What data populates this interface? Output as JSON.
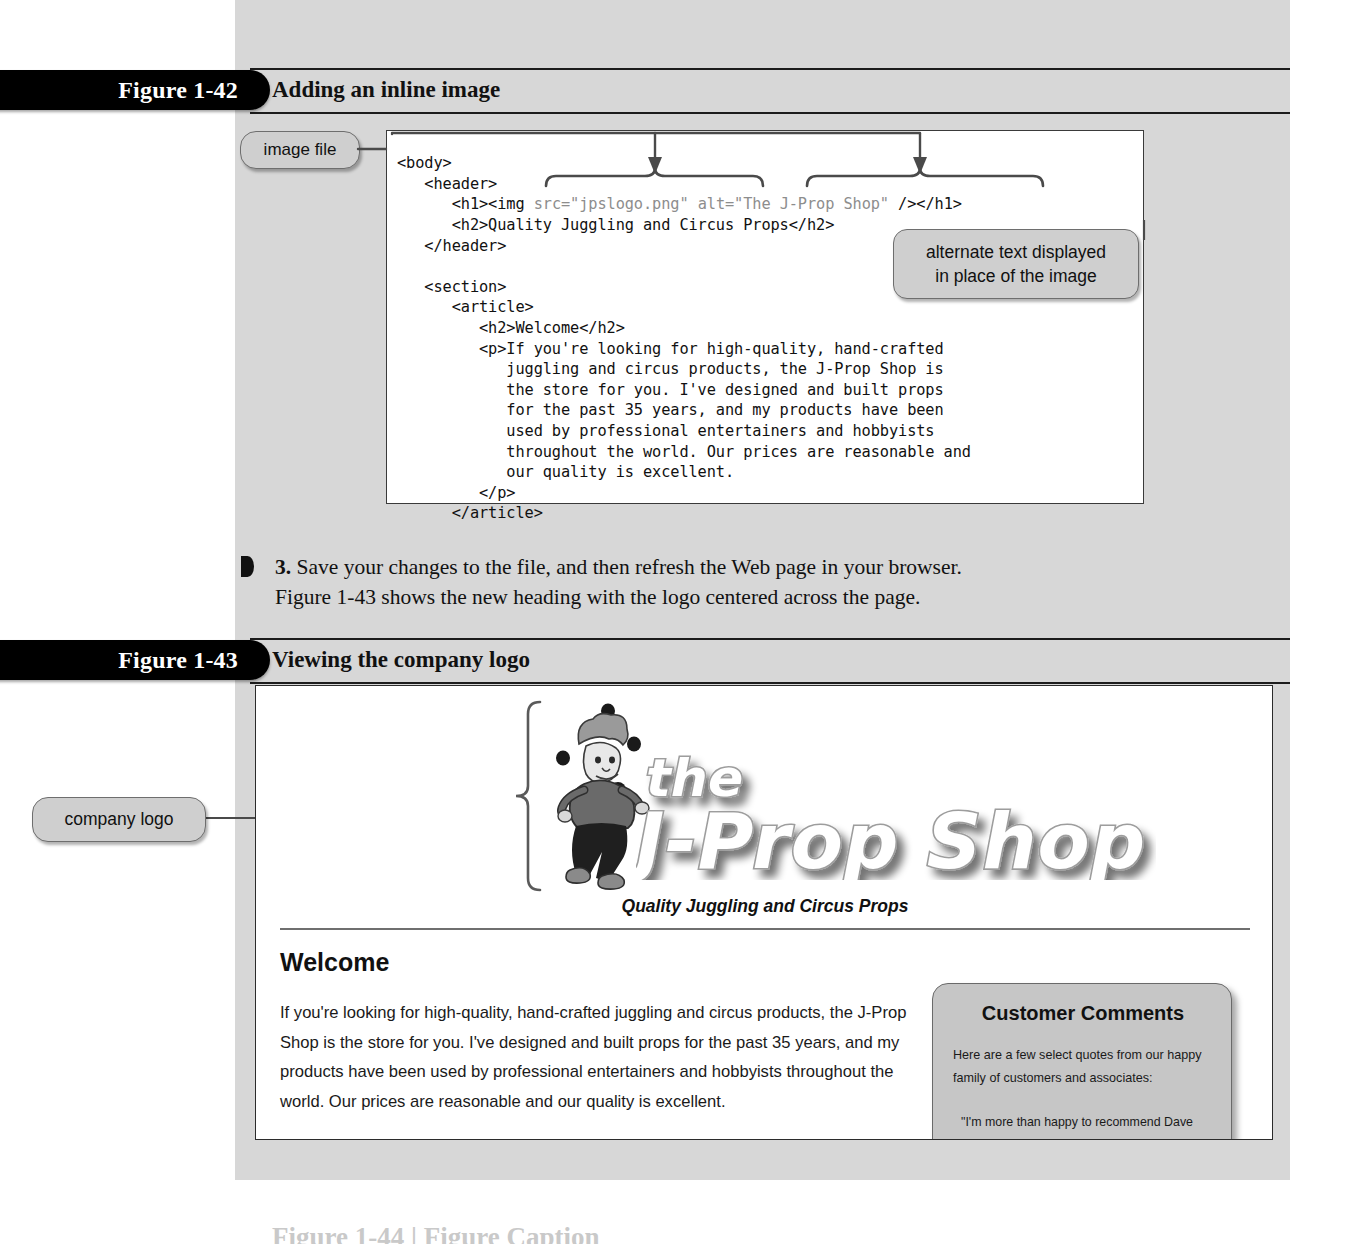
{
  "page": {
    "background_color": "#ffffff",
    "panel_color": "#d7d7d7",
    "accent_color": "#000000"
  },
  "figures": [
    {
      "id": "figure-1-42",
      "number": "Figure 1-42",
      "title": "Adding an inline image"
    },
    {
      "id": "figure-1-43",
      "number": "Figure 1-43",
      "title": "Viewing the company logo"
    }
  ],
  "code_figure": {
    "lines": [
      "<body>",
      "   <header>",
      "      <h1><img src=\"jpslogo.png\" alt=\"The J-Prop Shop\" /></h1>",
      "      <h2>Quality Juggling and Circus Props</h2>",
      "   </header>",
      "",
      "   <section>",
      "      <article>",
      "         <h2>Welcome</h2>",
      "         <p>If you're looking for high-quality, hand-crafted",
      "            juggling and circus products, the J-Prop Shop is",
      "            the store for you. I've designed and built props",
      "            for the past 35 years, and my products have been",
      "            used by professional entertainers and hobbyists",
      "            throughout the world. Our prices are reasonable and",
      "            our quality is excellent.",
      "         </p>",
      "      </article>"
    ]
  },
  "callouts": {
    "image_file": "image file",
    "alternate_text_line1": "alternate text displayed",
    "alternate_text_line2": "in place of the image",
    "company_logo": "company logo"
  },
  "step": {
    "number": "3.",
    "line1": "Save your changes to the file, and then refresh the Web page in your browser.",
    "line2": "Figure 1-43 shows the new heading with the logo centered across the page."
  },
  "browser_page": {
    "logo_alt": "The J-Prop Shop",
    "logo_word_top": "the",
    "logo_word_main": "J-Prop Shop",
    "tagline": "Quality Juggling and Circus Props",
    "welcome_heading": "Welcome",
    "welcome_paragraph": "If you're looking for high-quality, hand-crafted juggling and circus products, the J-Prop Shop is the store for you. I've designed and built props for the past 35 years, and my products have been used by professional entertainers and hobbyists throughout the world. Our prices are reasonable and our quality is excellent.",
    "sidebar": {
      "heading": "Customer Comments",
      "intro": "Here are a few select quotes from our happy family of customers and associates:",
      "quote": "\"I'm more than happy to recommend Dave"
    }
  },
  "next_section_heading": "Figure 1-44  |  Figure Caption"
}
